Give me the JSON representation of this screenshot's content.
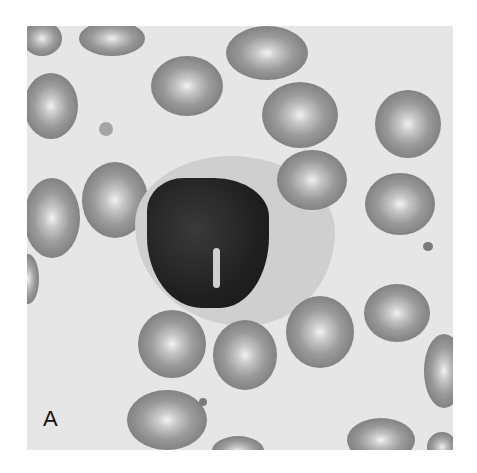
{
  "figure": {
    "panel_label": "A"
  }
}
